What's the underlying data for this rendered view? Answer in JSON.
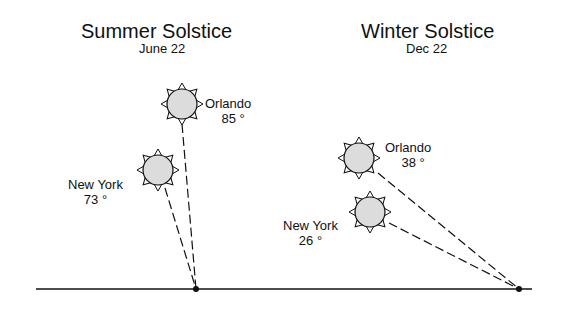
{
  "panels": [
    {
      "title": "Summer Solstice",
      "date": "June 22",
      "cities": [
        {
          "name": "Orlando",
          "angle": "85 °"
        },
        {
          "name": "New York",
          "angle": "73 °"
        }
      ]
    },
    {
      "title": "Winter Solstice",
      "date": "Dec 22",
      "cities": [
        {
          "name": "Orlando",
          "angle": "38 °"
        },
        {
          "name": "New York",
          "angle": "26 °"
        }
      ]
    }
  ],
  "colors": {
    "sun_fill": "#dcdcdc",
    "line": "#111111",
    "background": "#ffffff"
  }
}
